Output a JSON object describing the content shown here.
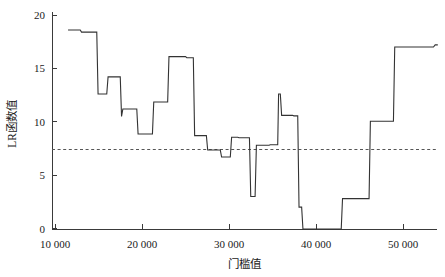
{
  "chart_data": {
    "type": "line",
    "title": "",
    "subtitle": "",
    "xlabel": "门槛值",
    "ylabel": "LR函数值",
    "xlim": [
      9000,
      54200
    ],
    "ylim": [
      0,
      20.8
    ],
    "xticks": [
      10000,
      20000,
      30000,
      40000,
      50000
    ],
    "xticklabels": [
      "10 000",
      "20 000",
      "30 000",
      "40 000",
      "50 000"
    ],
    "yticks": [
      0,
      5,
      10,
      15,
      20
    ],
    "yticklabels": [
      "0",
      "5",
      "10",
      "15",
      "20"
    ],
    "grid": false,
    "legend": null,
    "legend_position": "none",
    "line_color": "#333333",
    "threshold_color": "#555555",
    "annotations": [
      {
        "name": "critical-value-threshold",
        "type": "horizontal-dashed-line",
        "y": 7.4,
        "style": "dashed"
      }
    ],
    "series": [
      {
        "name": "LR函数值",
        "style": "step",
        "x": [
          11500,
          12900,
          13050,
          14800,
          14950,
          15950,
          16100,
          17500,
          17650,
          17800,
          18000,
          19400,
          19550,
          21200,
          21350,
          22950,
          23100,
          25000,
          25150,
          25900,
          26050,
          27400,
          27550,
          29000,
          29150,
          30150,
          30300,
          31000,
          31150,
          32350,
          32500,
          33000,
          33150,
          34600,
          34750,
          35600,
          35700,
          35900,
          36050,
          37300,
          37450,
          37900,
          38050,
          38350,
          38500,
          42900,
          43050,
          43900,
          44050,
          46100,
          46250,
          48900,
          49050,
          53500,
          53700,
          54000
        ],
        "y": [
          18.6,
          18.6,
          18.4,
          18.4,
          12.6,
          12.6,
          14.2,
          14.2,
          10.5,
          11.2,
          11.2,
          11.2,
          8.85,
          8.85,
          11.85,
          11.85,
          16.1,
          16.1,
          16.0,
          16.0,
          8.7,
          8.7,
          7.35,
          7.35,
          6.7,
          6.7,
          8.55,
          8.55,
          8.5,
          8.5,
          3.0,
          3.0,
          7.8,
          7.8,
          7.85,
          7.85,
          12.6,
          12.6,
          10.6,
          10.6,
          10.55,
          10.55,
          2.0,
          2.0,
          -0.05,
          -0.05,
          2.8,
          2.8,
          2.8,
          2.8,
          10.05,
          10.05,
          17.0,
          17.0,
          17.2,
          17.2
        ],
        "key_points": [
          {
            "x": 11500,
            "y": 18.6,
            "note": "series start / maximum plateau"
          },
          {
            "x": 14900,
            "y": 12.6,
            "note": "first steep drop"
          },
          {
            "x": 16050,
            "y": 14.2,
            "note": "local rebound"
          },
          {
            "x": 19500,
            "y": 8.85,
            "note": "local minimum plateau"
          },
          {
            "x": 23100,
            "y": 16.1,
            "note": "second high plateau"
          },
          {
            "x": 26050,
            "y": 8.7,
            "note": "drop below second plateau"
          },
          {
            "x": 30150,
            "y": 6.7,
            "note": "first dip below threshold"
          },
          {
            "x": 32450,
            "y": 3.0,
            "note": "narrow deep notch"
          },
          {
            "x": 35700,
            "y": 12.6,
            "note": "sharp spike"
          },
          {
            "x": 38450,
            "y": -0.05,
            "note": "global minimum plateau"
          },
          {
            "x": 43000,
            "y": 2.8,
            "note": "recovery step"
          },
          {
            "x": 46200,
            "y": 10.05,
            "note": "rise above threshold"
          },
          {
            "x": 49000,
            "y": 17.0,
            "note": "final high plateau"
          },
          {
            "x": 54000,
            "y": 17.2,
            "note": "series end"
          }
        ]
      }
    ]
  },
  "axes": {
    "x_axis_name": "threshold-axis",
    "y_axis_name": "lr-value-axis"
  }
}
